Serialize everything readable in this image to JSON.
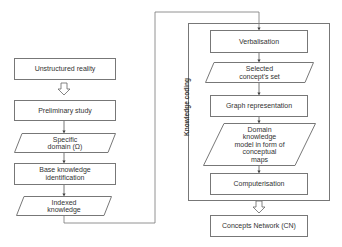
{
  "left_column": {
    "unstructured_reality": "Unstructured reality",
    "preliminary_study": "Preliminary study",
    "specific_domain": [
      "Specific",
      "domain (Ω)"
    ],
    "base_knowledge": [
      "Base knowledge",
      "identification"
    ],
    "indexed_knowledge": [
      "Indexed",
      "knowledge"
    ]
  },
  "knowledge_coding": {
    "label": "Knowledge coding",
    "verbalisation": "Verbalisation",
    "selected_concepts": [
      "Selected",
      "concept's set"
    ],
    "graph_representation": "Graph representation",
    "domain_knowledge_model": [
      "Domain",
      "knowledge",
      "model in form of",
      "conceptual",
      "maps"
    ],
    "computerisation": "Computerisation"
  },
  "output": {
    "concepts_network": "Concepts Network (CN)"
  },
  "colors": {
    "stroke": "#777777",
    "text": "#333333",
    "background": "#ffffff"
  }
}
